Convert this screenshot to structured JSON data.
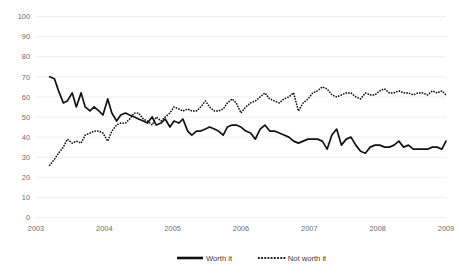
{
  "chart_data": {
    "type": "line",
    "title": "",
    "subtitle": "",
    "xlabel": "",
    "ylabel": "",
    "ylim": [
      0,
      100
    ],
    "xlim": [
      2003,
      2009
    ],
    "yticks": [
      0,
      10,
      20,
      30,
      40,
      50,
      60,
      70,
      80,
      90,
      100
    ],
    "xticks": [
      2003,
      2004,
      2005,
      2006,
      2007,
      2008,
      2009
    ],
    "xtick_labels": [
      "2003",
      "2004",
      "2005",
      "2006",
      "2007",
      "2008",
      "2009"
    ],
    "ytick_labels": [
      "0",
      "10",
      "20",
      "30",
      "40",
      "50",
      "60",
      "70",
      "80",
      "90",
      "100"
    ],
    "grid": "horizontal",
    "legend_position": "bottom-center",
    "series": [
      {
        "name": "Worth it",
        "style": "solid",
        "color": "#111111",
        "x": [
          2003.2,
          2003.27,
          2003.33,
          2003.4,
          2003.46,
          2003.53,
          2003.59,
          2003.66,
          2003.72,
          2003.79,
          2003.85,
          2003.92,
          2003.98,
          2004.05,
          2004.11,
          2004.18,
          2004.24,
          2004.31,
          2004.37,
          2004.44,
          2004.5,
          2004.57,
          2004.63,
          2004.7,
          2004.76,
          2004.83,
          2004.89,
          2004.96,
          2005.02,
          2005.09,
          2005.15,
          2005.22,
          2005.28,
          2005.35,
          2005.41,
          2005.48,
          2005.54,
          2005.61,
          2005.67,
          2005.74,
          2005.8,
          2005.87,
          2005.93,
          2006.0,
          2006.07,
          2006.14,
          2006.21,
          2006.28,
          2006.35,
          2006.42,
          2006.49,
          2006.56,
          2006.63,
          2006.7,
          2006.77,
          2006.84,
          2006.91,
          2006.98,
          2007.05,
          2007.12,
          2007.19,
          2007.26,
          2007.33,
          2007.4,
          2007.47,
          2007.54,
          2007.61,
          2007.68,
          2007.75,
          2007.82,
          2007.89,
          2007.96,
          2008.03,
          2008.1,
          2008.17,
          2008.24,
          2008.31,
          2008.38,
          2008.45,
          2008.52,
          2008.59,
          2008.66,
          2008.73,
          2008.8,
          2008.87,
          2008.94,
          2009.0
        ],
        "values": [
          70,
          69,
          63,
          57,
          58,
          62,
          55,
          62,
          55,
          53,
          55,
          53,
          51,
          59,
          52,
          48,
          51,
          52,
          51,
          50,
          49,
          48,
          47,
          50,
          46,
          47,
          49,
          45,
          48,
          47,
          49,
          43,
          41,
          43,
          43,
          44,
          45,
          44,
          43,
          41,
          45,
          46,
          46,
          45,
          43,
          42,
          39,
          44,
          46,
          43,
          43,
          42,
          41,
          40,
          38,
          37,
          38,
          39,
          39,
          39,
          38,
          34,
          41,
          44,
          36,
          39,
          40,
          36,
          33,
          32,
          35,
          36,
          36,
          35,
          35,
          36,
          38,
          35,
          36,
          34,
          34,
          34,
          34,
          35,
          35,
          34,
          38
        ]
      },
      {
        "name": "Not worth it",
        "style": "dotted",
        "color": "#111111",
        "x": [
          2003.2,
          2003.27,
          2003.33,
          2003.4,
          2003.46,
          2003.53,
          2003.59,
          2003.66,
          2003.72,
          2003.79,
          2003.85,
          2003.92,
          2003.98,
          2004.05,
          2004.11,
          2004.18,
          2004.24,
          2004.31,
          2004.37,
          2004.44,
          2004.5,
          2004.57,
          2004.63,
          2004.7,
          2004.76,
          2004.83,
          2004.89,
          2004.96,
          2005.02,
          2005.09,
          2005.15,
          2005.22,
          2005.28,
          2005.35,
          2005.41,
          2005.48,
          2005.54,
          2005.61,
          2005.67,
          2005.74,
          2005.8,
          2005.87,
          2005.93,
          2006.0,
          2006.07,
          2006.14,
          2006.21,
          2006.28,
          2006.35,
          2006.42,
          2006.49,
          2006.56,
          2006.63,
          2006.7,
          2006.77,
          2006.84,
          2006.91,
          2006.98,
          2007.05,
          2007.12,
          2007.19,
          2007.26,
          2007.33,
          2007.4,
          2007.47,
          2007.54,
          2007.61,
          2007.68,
          2007.75,
          2007.82,
          2007.89,
          2007.96,
          2008.03,
          2008.1,
          2008.17,
          2008.24,
          2008.31,
          2008.38,
          2008.45,
          2008.52,
          2008.59,
          2008.66,
          2008.73,
          2008.8,
          2008.87,
          2008.94,
          2009.0
        ],
        "values": [
          26,
          29,
          32,
          35,
          39,
          37,
          38,
          37,
          41,
          42,
          43,
          43,
          42,
          38,
          43,
          46,
          47,
          47,
          49,
          52,
          52,
          49,
          48,
          46,
          50,
          48,
          50,
          52,
          55,
          54,
          53,
          54,
          53,
          53,
          55,
          58,
          55,
          53,
          53,
          54,
          57,
          59,
          57,
          52,
          55,
          57,
          58,
          60,
          62,
          59,
          58,
          57,
          59,
          60,
          62,
          53,
          57,
          59,
          62,
          63,
          65,
          64,
          61,
          60,
          61,
          62,
          62,
          60,
          59,
          62,
          61,
          61,
          63,
          64,
          62,
          62,
          63,
          62,
          62,
          61,
          62,
          62,
          61,
          63,
          62,
          63,
          61
        ]
      }
    ]
  },
  "legend": {
    "items": [
      {
        "label": "Worth it",
        "style": "solid"
      },
      {
        "label": "Not worth it",
        "style": "dotted"
      }
    ]
  }
}
